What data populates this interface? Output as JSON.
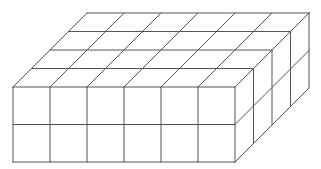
{
  "figure": {
    "cubes": {
      "length": 6,
      "width": 4,
      "height": 2
    },
    "line_color": "#555555",
    "background": "#ffffff"
  },
  "geometry": {
    "front_top_left": [
      13,
      87
    ],
    "front_bottom_right": [
      235,
      162
    ],
    "depth_offset": [
      74,
      -74
    ]
  }
}
